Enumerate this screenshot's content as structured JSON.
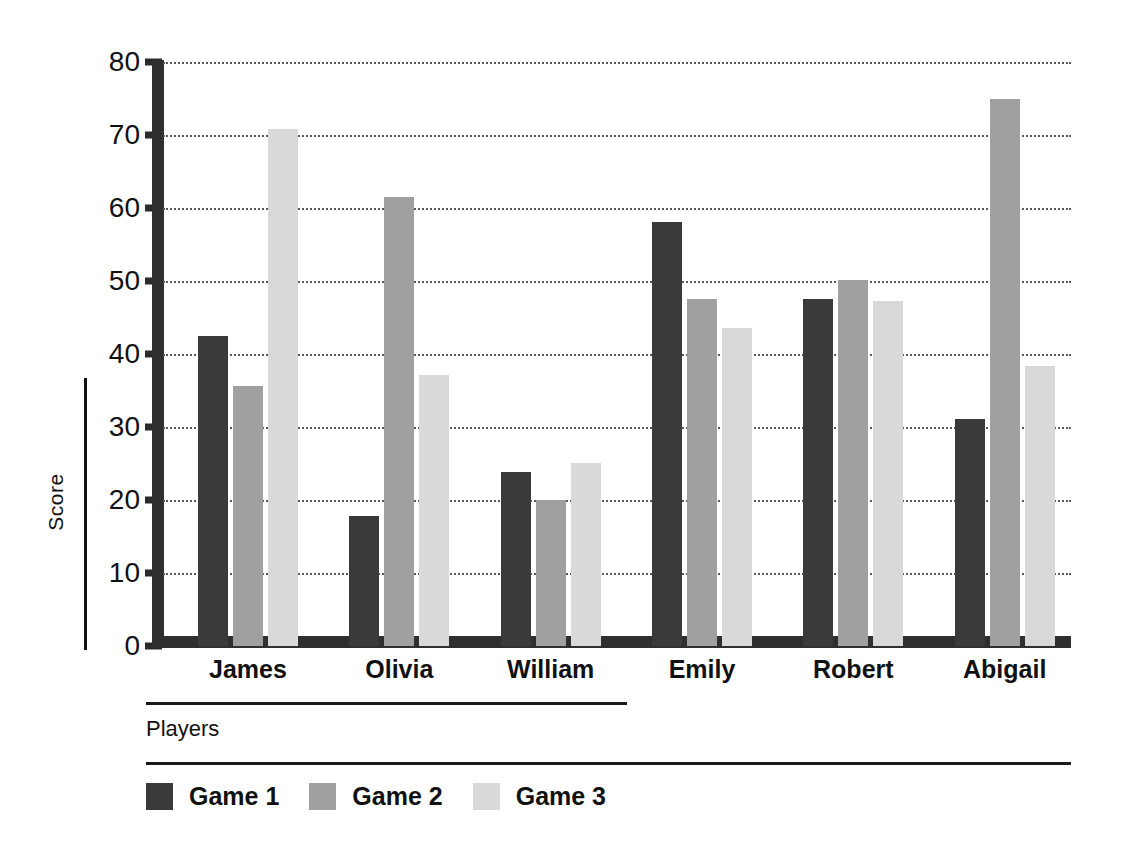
{
  "chart_data": {
    "type": "bar",
    "title": "",
    "xlabel": "Players",
    "ylabel": "Score",
    "ylim": [
      0,
      80
    ],
    "ytick_values": [
      0,
      10,
      20,
      30,
      40,
      50,
      60,
      70,
      80
    ],
    "ytick_labels": [
      "0",
      "10",
      "20",
      "30",
      "40",
      "50",
      "60",
      "70",
      "80"
    ],
    "grid": true,
    "grid_axis": "y",
    "grid_style": "dotted",
    "legend_position": "bottom-left",
    "orientation": "vertical",
    "grouping": "grouped",
    "categories": [
      "James",
      "Olivia",
      "William",
      "Emily",
      "Robert",
      "Abigail"
    ],
    "series": [
      {
        "name": "Game 1",
        "color": "#3a3a3a",
        "values": [
          42.5,
          17.8,
          23.9,
          58.1,
          47.5,
          31.1
        ]
      },
      {
        "name": "Game 2",
        "color": "#a0a0a0",
        "values": [
          35.6,
          61.5,
          20.0,
          47.5,
          50.1,
          75.0
        ]
      },
      {
        "name": "Game 3",
        "color": "#d9d9d9",
        "values": [
          70.8,
          37.1,
          25.1,
          43.6,
          47.3,
          38.4
        ]
      }
    ]
  },
  "axis": {
    "y_label": "Score",
    "x_label": "Players"
  },
  "legend": {
    "items": [
      {
        "label": "Game 1",
        "color": "#3a3a3a"
      },
      {
        "label": "Game 2",
        "color": "#a0a0a0"
      },
      {
        "label": "Game 3",
        "color": "#d9d9d9"
      }
    ]
  },
  "colors": {
    "background": "#ffffff",
    "axis": "#2f2f2f",
    "grid": "#5a5a5a",
    "text": "#111111",
    "series_1": "#3a3a3a",
    "series_2": "#a0a0a0",
    "series_3": "#d9d9d9"
  }
}
